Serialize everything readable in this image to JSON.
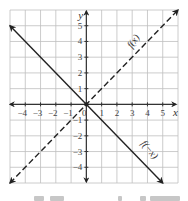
{
  "chart_data": {
    "type": "line",
    "title": "",
    "xlabel": "x",
    "ylabel": "y",
    "xlim": [
      -5,
      6
    ],
    "ylim": [
      -5,
      6
    ],
    "grid": true,
    "x_ticks": [
      -4,
      -3,
      -2,
      -1,
      0,
      1,
      2,
      3,
      4,
      5
    ],
    "y_ticks": [
      -4,
      -3,
      -2,
      -1,
      1,
      2,
      3,
      4,
      5
    ],
    "x_tick_labels": [
      "−4",
      "−3",
      "−2",
      "−1",
      "0",
      "1",
      "2",
      "3",
      "4",
      "5"
    ],
    "y_tick_labels": [
      "−4",
      "−3",
      "−2",
      "−1",
      "1",
      "2",
      "3",
      "4",
      "5"
    ],
    "series": [
      {
        "name": "f(x)",
        "style": "dashed",
        "x": [
          -5,
          6
        ],
        "y": [
          -5,
          6
        ],
        "arrows": "both",
        "label_position": [
          3,
          4
        ]
      },
      {
        "name": "f(−x)",
        "style": "solid",
        "x": [
          -5,
          5
        ],
        "y": [
          5,
          -5
        ],
        "arrows": "both",
        "label_position": [
          3.8,
          -2.8
        ]
      }
    ],
    "annotations": [
      "f(x)",
      "f(−x)"
    ],
    "origin_point": [
      0,
      0
    ]
  },
  "axis": {
    "x_label": "x",
    "y_label": "y",
    "origin_label": "0"
  },
  "colors": {
    "grid": "#bfbfbf",
    "axis": "#333333",
    "line": "#222222",
    "background": "#ffffff"
  }
}
